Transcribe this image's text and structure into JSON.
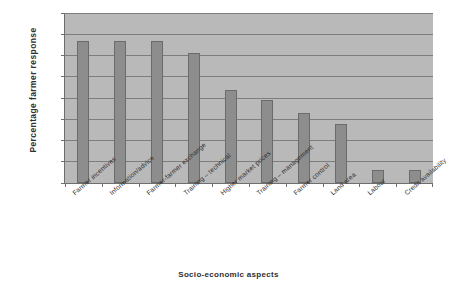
{
  "chart_data": {
    "type": "bar",
    "title": "",
    "xlabel": "Socio-economic aspects",
    "ylabel": "Percentage  farmer  response",
    "ylim": [
      0,
      80
    ],
    "yticks": [
      0,
      10,
      20,
      30,
      40,
      50,
      60,
      70,
      80
    ],
    "grid": true,
    "legend": "none",
    "categories": [
      "Farmer incentives",
      "Information/advice",
      "Farmer-farmer exchange",
      "Training – technical",
      "Higher market prices",
      "Training – management",
      "Farmer control",
      "Land area",
      "Labour",
      "Credit availability"
    ],
    "values": [
      67,
      67,
      67,
      61,
      44,
      39,
      33,
      28,
      6,
      6
    ],
    "colors": {
      "bar_fill": "#8d8d8d",
      "bar_edge": "#6b6b6b",
      "plot_background": "#b9b9b9",
      "gridline": "#7d7d7d",
      "axis": "#6e6e6e",
      "text": "#2f2f2f",
      "figure_background": "#ffffff"
    }
  }
}
